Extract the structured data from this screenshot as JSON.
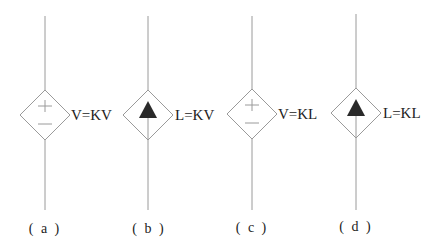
{
  "figure": {
    "colors": {
      "line": "#9a9a9a",
      "arrow_fill": "#2a2a2a",
      "text": "#222222",
      "background": "#ffffff"
    },
    "elements": [
      {
        "id": "a",
        "type": "dependent-voltage-source",
        "symbol": "plus-minus",
        "equation": "V=KV",
        "caption": "( a )"
      },
      {
        "id": "b",
        "type": "dependent-current-source",
        "symbol": "filled-arrow-up",
        "equation": "L=KV",
        "caption": "( b )"
      },
      {
        "id": "c",
        "type": "dependent-voltage-source",
        "symbol": "plus-minus",
        "equation": "V=KL",
        "caption": "( c )"
      },
      {
        "id": "d",
        "type": "dependent-current-source",
        "symbol": "filled-arrow-up",
        "equation": "L=KL",
        "caption": "( d )"
      }
    ]
  }
}
